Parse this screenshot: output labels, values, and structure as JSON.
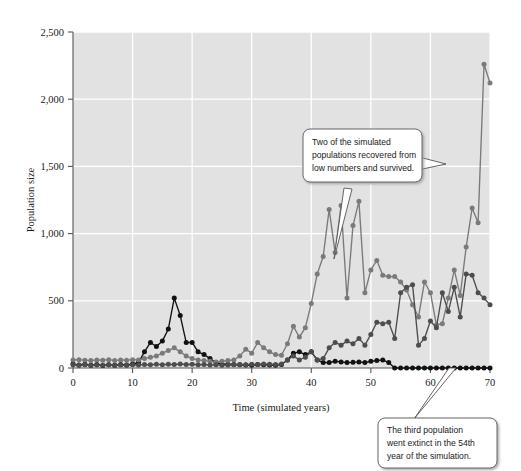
{
  "figure": {
    "background_color": "#ffffff",
    "plot_background_color": "#e2e2e2",
    "gridline_color": "#ffffff",
    "axis_color": "#555555"
  },
  "annotations": [
    {
      "id": "callout-recovered",
      "line1": "Two of the simulated",
      "line2": "populations recovered from",
      "line3": "low numbers and survived."
    },
    {
      "id": "callout-extinct",
      "line1": "The third population",
      "line2": "went extinct in the 54th",
      "line3": "year of the simulation."
    }
  ],
  "chart_data": {
    "type": "line",
    "title": "",
    "xlabel": "Time (simulated years)",
    "ylabel": "Population size",
    "xlim": [
      0,
      70
    ],
    "ylim": [
      0,
      2500
    ],
    "xticks": [
      0,
      10,
      20,
      30,
      40,
      50,
      60,
      70
    ],
    "xtick_labels": [
      "0",
      "10",
      "20",
      "30",
      "40",
      "50",
      "60",
      "70"
    ],
    "yticks": [
      0,
      500,
      1000,
      1500,
      2000,
      2500
    ],
    "ytick_labels": [
      "0",
      "500",
      "1,000",
      "1,500",
      "2,000",
      "2,500"
    ],
    "grid": true,
    "legend": "none",
    "marker": "circle",
    "x": [
      0,
      1,
      2,
      3,
      4,
      5,
      6,
      7,
      8,
      9,
      10,
      11,
      12,
      13,
      14,
      15,
      16,
      17,
      18,
      19,
      20,
      21,
      22,
      23,
      24,
      25,
      26,
      27,
      28,
      29,
      30,
      31,
      32,
      33,
      34,
      35,
      36,
      37,
      38,
      39,
      40,
      41,
      42,
      43,
      44,
      45,
      46,
      47,
      48,
      49,
      50,
      51,
      52,
      53,
      54,
      55,
      56,
      57,
      58,
      59,
      60,
      61,
      62,
      63,
      64,
      65,
      66,
      67,
      68,
      69,
      70
    ],
    "series": [
      {
        "name": "population-1-extinct",
        "color": "#111111",
        "note": "The third population went extinct in the 54th year of the simulation.",
        "values": [
          30,
          22,
          28,
          20,
          26,
          18,
          24,
          20,
          26,
          22,
          30,
          40,
          120,
          190,
          160,
          200,
          290,
          520,
          390,
          190,
          190,
          120,
          100,
          70,
          40,
          30,
          28,
          26,
          24,
          22,
          20,
          26,
          24,
          22,
          20,
          26,
          60,
          110,
          120,
          100,
          120,
          60,
          40,
          40,
          50,
          45,
          40,
          42,
          45,
          40,
          50,
          55,
          60,
          40,
          0,
          0,
          0,
          0,
          0,
          0,
          0,
          0,
          0,
          0,
          0,
          0,
          0,
          0,
          0,
          0,
          0
        ]
      },
      {
        "name": "population-2-recovered",
        "color": "#7a7a7a",
        "note": "Recovered from low numbers and survived; rises strongly after year 40.",
        "values": [
          60,
          62,
          58,
          55,
          60,
          58,
          62,
          55,
          60,
          58,
          62,
          60,
          70,
          80,
          90,
          110,
          130,
          150,
          120,
          90,
          70,
          60,
          55,
          50,
          45,
          50,
          55,
          60,
          90,
          140,
          110,
          190,
          150,
          120,
          100,
          95,
          180,
          310,
          230,
          300,
          480,
          700,
          830,
          1180,
          860,
          1210,
          520,
          1060,
          1240,
          560,
          730,
          800,
          690,
          680,
          680,
          640,
          580,
          470,
          380,
          640,
          560,
          320,
          330,
          520,
          730,
          540,
          900,
          1190,
          1080,
          2260,
          2120
        ]
      },
      {
        "name": "population-3-recovered",
        "color": "#4d4d4d",
        "note": "Recovered from low numbers and survived; fluctuates then rises late.",
        "values": [
          25,
          20,
          24,
          18,
          22,
          20,
          24,
          18,
          22,
          20,
          24,
          22,
          26,
          24,
          28,
          24,
          28,
          26,
          30,
          26,
          28,
          24,
          26,
          22,
          24,
          20,
          22,
          24,
          26,
          24,
          28,
          26,
          30,
          28,
          26,
          30,
          60,
          90,
          60,
          80,
          120,
          60,
          70,
          150,
          190,
          170,
          200,
          180,
          220,
          170,
          250,
          340,
          330,
          340,
          220,
          560,
          600,
          620,
          170,
          220,
          350,
          300,
          560,
          420,
          600,
          380,
          700,
          690,
          560,
          520,
          470
        ]
      }
    ]
  }
}
